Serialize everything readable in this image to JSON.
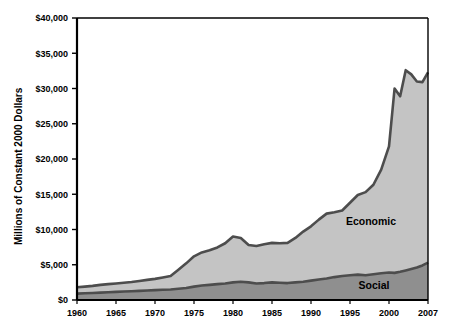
{
  "chart_data": {
    "type": "area",
    "stacked": true,
    "title": "",
    "xlabel": "",
    "ylabel": "Millions of Constant 2000 Dollars",
    "xlim": [
      1960,
      2007
    ],
    "ylim": [
      0,
      40000
    ],
    "grid": false,
    "legend_position": "inline-annotation",
    "y_ticks": [
      0,
      5000,
      10000,
      15000,
      20000,
      25000,
      30000,
      35000,
      40000
    ],
    "y_tick_labels": [
      "$0",
      "$5,000",
      "$10,000",
      "$15,000",
      "$20,000",
      "$25,000",
      "$30,000",
      "$35,000",
      "$40,000"
    ],
    "x_ticks": [
      1960,
      1965,
      1970,
      1975,
      1980,
      1985,
      1990,
      1995,
      2000,
      2007
    ],
    "x_tick_labels": [
      "1960",
      "1965",
      "1970",
      "1975",
      "1980",
      "1985",
      "1990",
      "1995",
      "2000",
      "2007"
    ],
    "x": [
      1960,
      1961,
      1962,
      1963,
      1964,
      1965,
      1966,
      1967,
      1968,
      1969,
      1970,
      1971,
      1972,
      1973,
      1974,
      1975,
      1976,
      1977,
      1978,
      1979,
      1980,
      1981,
      1982,
      1983,
      1984,
      1985,
      1986,
      1987,
      1988,
      1989,
      1990,
      1991,
      1992,
      1993,
      1994,
      1995,
      1996,
      1997,
      1998,
      1999,
      2000,
      2001,
      2002,
      2003,
      2004,
      2005,
      2006,
      2007
    ],
    "series": [
      {
        "name": "Social",
        "color": "#8f8f8f",
        "values": [
          900,
          950,
          1000,
          1050,
          1100,
          1150,
          1200,
          1250,
          1300,
          1350,
          1400,
          1450,
          1500,
          1600,
          1700,
          1900,
          2050,
          2150,
          2250,
          2350,
          2500,
          2600,
          2500,
          2350,
          2400,
          2500,
          2450,
          2400,
          2500,
          2600,
          2750,
          2900,
          3050,
          3250,
          3400,
          3500,
          3600,
          3500,
          3650,
          3800,
          3900,
          3850,
          4000,
          4200,
          4400,
          4600,
          4900,
          5300
        ]
      },
      {
        "name": "Economic",
        "color": "#c4c4c4",
        "values": [
          900,
          950,
          1000,
          1100,
          1150,
          1200,
          1250,
          1300,
          1400,
          1500,
          1600,
          1750,
          1900,
          2700,
          3500,
          4300,
          4700,
          4900,
          5200,
          5700,
          6500,
          6200,
          5300,
          5300,
          5500,
          5600,
          5600,
          5700,
          6300,
          7100,
          7700,
          8500,
          9200,
          9200,
          9300,
          10300,
          11300,
          11800,
          12700,
          14700,
          17900,
          26150,
          24900,
          28400,
          27600,
          26400,
          26000,
          27000
        ]
      }
    ],
    "series_totals": [
      1800,
      1900,
      2000,
      2150,
      2250,
      2350,
      2450,
      2550,
      2700,
      2850,
      3000,
      3200,
      3400,
      4300,
      5200,
      6200,
      6750,
      7050,
      7450,
      8050,
      9000,
      8800,
      7800,
      7650,
      7900,
      8100,
      8050,
      8100,
      8800,
      9700,
      10450,
      11400,
      12250,
      12450,
      12700,
      13800,
      14900,
      15300,
      16350,
      18500,
      21800,
      30000,
      28900,
      32600,
      32000,
      31000,
      30900,
      32300
    ],
    "annotations": [
      {
        "text": "Economic",
        "x_pixel": 371,
        "y_pixel": 225
      },
      {
        "text": "Social",
        "x_pixel": 374,
        "y_pixel": 289
      }
    ]
  },
  "axis": {
    "y_title": "Millions of Constant 2000 Dollars"
  },
  "colors": {
    "social_fill": "#8f8f8f",
    "economic_fill": "#c4c4c4",
    "line": "#4d4d4d",
    "axis": "#000000",
    "background": "#ffffff"
  }
}
